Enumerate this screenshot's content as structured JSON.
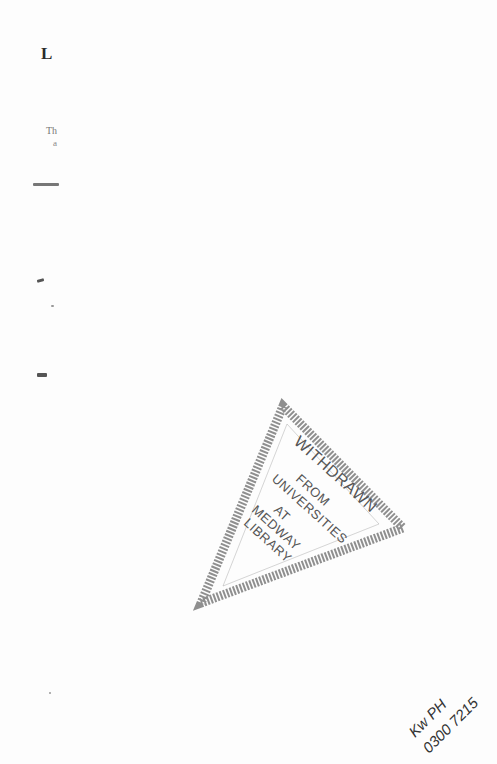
{
  "page": {
    "initial_letter": "L",
    "fragment_line_1": "Th",
    "fragment_line_2": "a"
  },
  "stamp": {
    "line1": "WITHDRAWN",
    "line2": "FROM",
    "line3": "UNIVERSITIES",
    "line4": "AT",
    "line5": "MEDWAY",
    "line6": "LIBRARY"
  },
  "handwriting": {
    "line1": "Kw PH",
    "line2": "0300 7215"
  },
  "colors": {
    "paper": "#fdfdfd",
    "ink": "#222222",
    "stamp_ink": "#555555"
  }
}
